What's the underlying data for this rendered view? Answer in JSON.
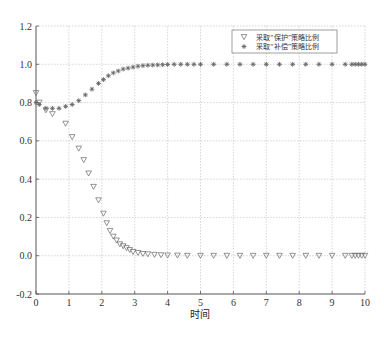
{
  "chart_data": {
    "type": "scatter",
    "title": "",
    "xlabel": "时间",
    "ylabel": "",
    "xlim": [
      0,
      10
    ],
    "ylim": [
      -0.2,
      1.2
    ],
    "xticks": [
      "0",
      "1",
      "2",
      "3",
      "4",
      "5",
      "6",
      "7",
      "8",
      "9",
      "10"
    ],
    "yticks": [
      "-0.2",
      "0.0",
      "0.2",
      "0.4",
      "0.6",
      "0.8",
      "1.0",
      "1.2"
    ],
    "grid": true,
    "legend_position": "upper right",
    "series": [
      {
        "name": "采取“保护”策略比例",
        "marker": "triangle-down",
        "x": [
          0,
          0.1,
          0.3,
          0.5,
          0.9,
          1.1,
          1.3,
          1.45,
          1.6,
          1.75,
          1.9,
          2.05,
          2.15,
          2.25,
          2.35,
          2.45,
          2.55,
          2.65,
          2.75,
          2.85,
          2.95,
          3.1,
          3.25,
          3.4,
          3.6,
          3.8,
          4.0,
          4.3,
          4.6,
          5.0,
          5.4,
          5.8,
          6.2,
          6.6,
          7.0,
          7.4,
          7.8,
          8.2,
          8.6,
          9.0,
          9.4,
          9.6,
          9.7,
          9.8,
          9.9,
          10.0
        ],
        "y": [
          0.85,
          0.8,
          0.76,
          0.74,
          0.69,
          0.62,
          0.56,
          0.5,
          0.43,
          0.36,
          0.29,
          0.22,
          0.17,
          0.13,
          0.1,
          0.08,
          0.06,
          0.05,
          0.04,
          0.03,
          0.02,
          0.015,
          0.01,
          0.008,
          0.005,
          0.003,
          0.002,
          0.001,
          0.0,
          0.0,
          0.0,
          0.0,
          0.0,
          0.0,
          0.0,
          0.0,
          0.0,
          0.0,
          0.0,
          0.0,
          0.0,
          0.0,
          0.0,
          0.0,
          0.0,
          0.0
        ]
      },
      {
        "name": "采取“补偿”策略比例",
        "marker": "asterisk",
        "x": [
          0,
          0.1,
          0.3,
          0.5,
          0.7,
          0.9,
          1.1,
          1.3,
          1.5,
          1.7,
          1.9,
          2.05,
          2.2,
          2.35,
          2.5,
          2.65,
          2.8,
          2.95,
          3.1,
          3.25,
          3.4,
          3.55,
          3.7,
          3.85,
          4.0,
          4.2,
          4.4,
          4.6,
          4.8,
          5.0,
          5.4,
          5.8,
          6.2,
          6.6,
          7.0,
          7.4,
          7.8,
          8.2,
          8.6,
          9.0,
          9.4,
          9.6,
          9.7,
          9.8,
          9.9,
          10.0
        ],
        "y": [
          0.8,
          0.79,
          0.77,
          0.77,
          0.77,
          0.78,
          0.79,
          0.81,
          0.84,
          0.87,
          0.9,
          0.92,
          0.94,
          0.955,
          0.965,
          0.975,
          0.98,
          0.985,
          0.99,
          0.993,
          0.995,
          0.996,
          0.997,
          0.998,
          0.999,
          1.0,
          1.0,
          1.0,
          1.0,
          1.0,
          1.0,
          1.0,
          1.0,
          1.0,
          1.0,
          1.0,
          1.0,
          1.0,
          1.0,
          1.0,
          1.0,
          1.0,
          1.0,
          1.0,
          1.0,
          1.0
        ]
      }
    ]
  },
  "colors": {
    "axis": "#555555",
    "grid": "#bbbbbb",
    "marker": "#666666",
    "background": "#ffffff"
  }
}
